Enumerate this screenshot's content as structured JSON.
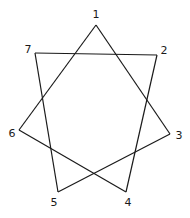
{
  "diagram": {
    "type": "heptagram",
    "stroke_color": "#1a1a1a",
    "background": "#ffffff",
    "vertices": [
      {
        "id": "1",
        "label": "1",
        "x": 96,
        "y": 25,
        "lx": 96,
        "ly": 18
      },
      {
        "id": "2",
        "label": "2",
        "x": 157,
        "y": 55,
        "lx": 164,
        "ly": 54
      },
      {
        "id": "3",
        "label": "3",
        "x": 170,
        "y": 134,
        "lx": 179,
        "ly": 139
      },
      {
        "id": "4",
        "label": "4",
        "x": 126,
        "y": 192,
        "lx": 128,
        "ly": 206
      },
      {
        "id": "5",
        "label": "5",
        "x": 58,
        "y": 192,
        "lx": 54,
        "ly": 206
      },
      {
        "id": "6",
        "label": "6",
        "x": 19,
        "y": 130,
        "lx": 12,
        "ly": 137
      },
      {
        "id": "7",
        "label": "7",
        "x": 35,
        "y": 53,
        "lx": 28,
        "ly": 53
      }
    ],
    "edges": [
      [
        "1",
        "3"
      ],
      [
        "3",
        "5"
      ],
      [
        "5",
        "7"
      ],
      [
        "7",
        "2"
      ],
      [
        "2",
        "4"
      ],
      [
        "4",
        "6"
      ],
      [
        "6",
        "1"
      ]
    ]
  }
}
